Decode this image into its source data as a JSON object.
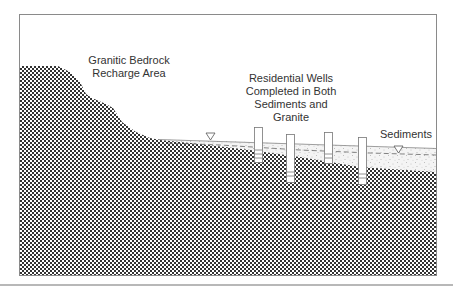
{
  "diagram": {
    "type": "hydrogeologic cross-section",
    "labels": {
      "bedrock_recharge": [
        "Granitic Bedrock",
        "Recharge Area"
      ],
      "wells": [
        "Residential Wells",
        "Completed in Both",
        "Sediments and",
        "Granite"
      ],
      "sediments": "Sediments"
    },
    "units": [
      {
        "name": "Granitic Bedrock",
        "pattern": "checkerboard"
      },
      {
        "name": "Sediments",
        "pattern": "stipple"
      }
    ],
    "symbols": {
      "water_table": "inverted-triangle",
      "water_table_line": "dashed"
    },
    "wells": [
      {
        "id": 1,
        "x": 259,
        "top": 127,
        "bottom": 162,
        "screened_in": "sediments"
      },
      {
        "id": 2,
        "x": 290,
        "top": 134,
        "bottom": 182,
        "screened_in": "granite"
      },
      {
        "id": 3,
        "x": 328,
        "top": 132,
        "bottom": 163,
        "screened_in": "sediments"
      },
      {
        "id": 4,
        "x": 362,
        "top": 137,
        "bottom": 184,
        "screened_in": "granite"
      }
    ],
    "colors": {
      "frame": "#8a8a8a",
      "pattern_dark": "#333333",
      "pattern_light": "#ffffff",
      "text": "#333333"
    }
  }
}
